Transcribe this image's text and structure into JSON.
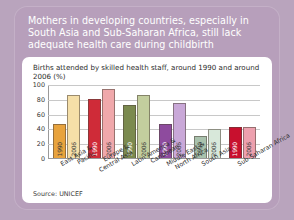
{
  "headline": "Mothers in developing countries, especially in South Asia and Sub-Saharan Africa, still lack adequate health care during childbirth",
  "source": "Source: UNICEF",
  "colors": {
    "page_background": "#b9a4bd",
    "card_background": "#b79fbb",
    "panel_background": "#ffffff",
    "title_text": "#ffffff",
    "axis": "#9a9a9a",
    "grid": "#c8c8c8"
  },
  "chart_data": {
    "type": "bar",
    "title": "Births attended by skilled health staff, around 1990 and around 2006 (%)",
    "xlabel": "",
    "ylabel": "",
    "ylim": [
      0,
      100
    ],
    "yticks": [
      100,
      80,
      60,
      40,
      20,
      0
    ],
    "grid": true,
    "legend": "none",
    "series_labels": [
      "1990",
      "2006"
    ],
    "categories": [
      "East Asia & Pacific",
      "Europe & Central Asia",
      "Latin America & Caribbean",
      "Middle East & North Africa",
      "South Asia",
      "Sub-Saharan Africa"
    ],
    "series": [
      {
        "name": "1990",
        "values": [
          46,
          81,
          72,
          46,
          30,
          42
        ]
      },
      {
        "name": "2006",
        "values": [
          87,
          95,
          87,
          76,
          40,
          43
        ]
      }
    ],
    "bar_colors": [
      {
        "category": "East Asia & Pacific",
        "1990": "#e8a33d",
        "2006": "#f5dfa8"
      },
      {
        "category": "Europe & Central Asia",
        "1990": "#cf2b38",
        "2006": "#f0a8ab"
      },
      {
        "category": "Latin America & Caribbean",
        "1990": "#7b8a4f",
        "2006": "#c3ce9e"
      },
      {
        "category": "Middle East & North Africa",
        "1990": "#8e4b9e",
        "2006": "#c9a8d8"
      },
      {
        "category": "South Asia",
        "1990": "#a9c2ad",
        "2006": "#d8e8da"
      },
      {
        "category": "Sub-Saharan Africa",
        "1990": "#c8102e",
        "2006": "#eda0ae"
      }
    ]
  }
}
